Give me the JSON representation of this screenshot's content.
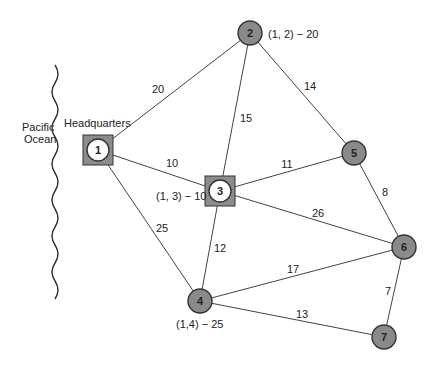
{
  "diagram": {
    "ocean_label_line1": "Pacific",
    "ocean_label_line2": "Ocean",
    "hq_label": "Headquarters",
    "colors": {
      "edge": "#444444",
      "node_fill": "#8a8a8a",
      "node_stroke": "#333333",
      "square_fill": "#8c8c8c",
      "hq_circle_fill": "#ffffff"
    },
    "nodes": [
      {
        "id": "1",
        "label": "1",
        "x": 98,
        "y": 150,
        "type": "square-white"
      },
      {
        "id": "2",
        "label": "2",
        "x": 250,
        "y": 33,
        "type": "gray"
      },
      {
        "id": "3",
        "label": "3",
        "x": 220,
        "y": 191,
        "type": "square-white"
      },
      {
        "id": "4",
        "label": "4",
        "x": 200,
        "y": 301,
        "type": "gray"
      },
      {
        "id": "5",
        "label": "5",
        "x": 354,
        "y": 153,
        "type": "gray"
      },
      {
        "id": "6",
        "label": "6",
        "x": 404,
        "y": 247,
        "type": "gray"
      },
      {
        "id": "7",
        "label": "7",
        "x": 384,
        "y": 337,
        "type": "gray"
      }
    ],
    "edges": [
      {
        "from": "1",
        "to": "2",
        "weight": "20",
        "lx": 158,
        "ly": 93
      },
      {
        "from": "1",
        "to": "3",
        "weight": "10",
        "lx": 172,
        "ly": 167
      },
      {
        "from": "1",
        "to": "4",
        "weight": "25",
        "lx": 162,
        "ly": 232
      },
      {
        "from": "2",
        "to": "3",
        "weight": "15",
        "lx": 246,
        "ly": 122
      },
      {
        "from": "2",
        "to": "5",
        "weight": "14",
        "lx": 310,
        "ly": 90
      },
      {
        "from": "3",
        "to": "5",
        "weight": "11",
        "lx": 287,
        "ly": 168
      },
      {
        "from": "3",
        "to": "6",
        "weight": "26",
        "lx": 318,
        "ly": 217
      },
      {
        "from": "3",
        "to": "4",
        "weight": "12",
        "lx": 220,
        "ly": 252
      },
      {
        "from": "5",
        "to": "6",
        "weight": "8",
        "lx": 385,
        "ly": 196
      },
      {
        "from": "4",
        "to": "6",
        "weight": "17",
        "lx": 293,
        "ly": 273
      },
      {
        "from": "4",
        "to": "7",
        "weight": "13",
        "lx": 302,
        "ly": 318
      },
      {
        "from": "6",
        "to": "7",
        "weight": "7",
        "lx": 388,
        "ly": 295
      }
    ],
    "annotations": [
      {
        "text": "(1, 2) − 20",
        "x": 268,
        "y": 38
      },
      {
        "text": "(1, 3) − 10",
        "x": 156,
        "y": 200
      },
      {
        "text": "(1,4) − 25",
        "x": 176,
        "y": 328
      }
    ]
  }
}
